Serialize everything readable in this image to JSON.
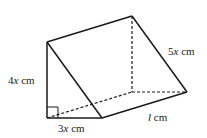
{
  "figure": {
    "type": "triangular-prism",
    "labels": {
      "height": {
        "coef": "4",
        "var": "x",
        "unit": " cm"
      },
      "base": {
        "coef": "3",
        "var": "x",
        "unit": " cm"
      },
      "hypotenuse": {
        "coef": "5",
        "var": "x",
        "unit": " cm"
      },
      "length": {
        "coef": "",
        "var": "l",
        "unit": " cm"
      }
    },
    "right_angle_marker": true,
    "colors": {
      "stroke": "#1a1a1a",
      "background": "#ffffff"
    }
  }
}
